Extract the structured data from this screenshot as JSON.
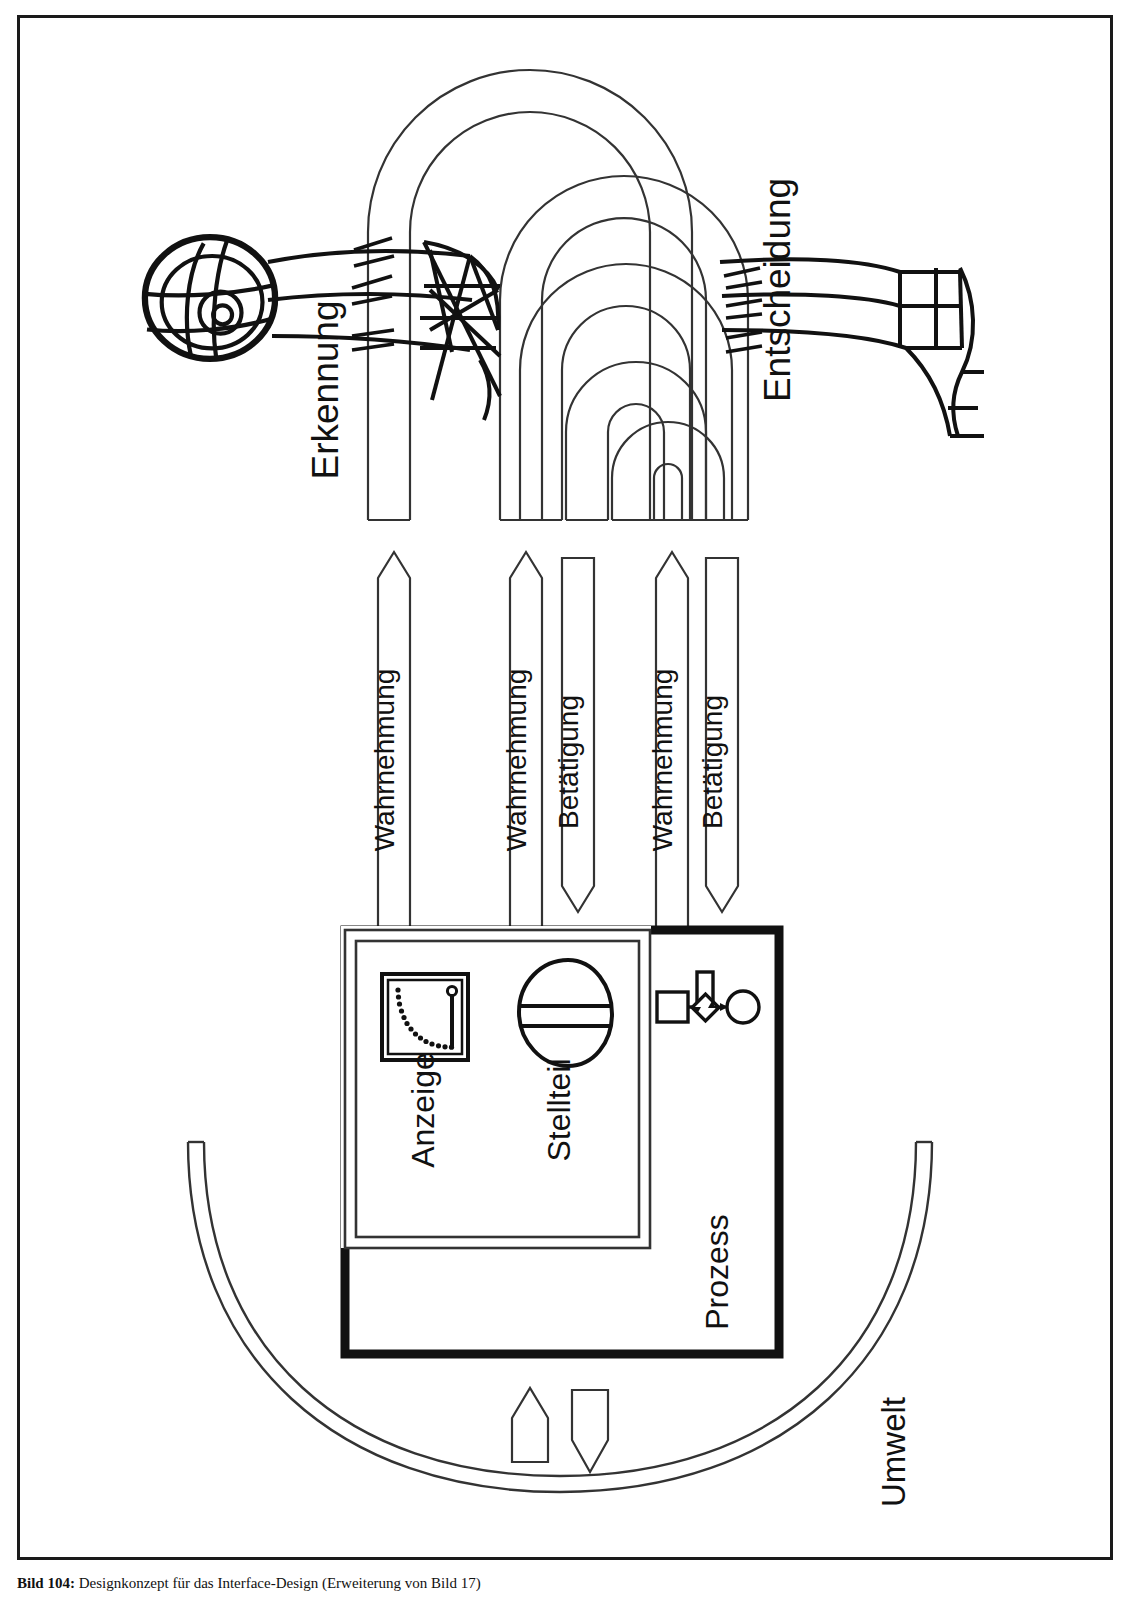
{
  "figure": {
    "caption_label": "Bild 104:",
    "caption_text": " Designkonzept für das Interface-Design (Erweiterung von Bild 17)"
  },
  "labels": {
    "erkennung": "Erkennung",
    "entscheidung": "Entscheidung",
    "umwelt": "Umwelt",
    "anzeige": "Anzeige",
    "stellteil": "Stellteil",
    "prozess": "Prozess"
  },
  "flows": [
    {
      "id": "wahrnehmung-1",
      "label": "Wahrnehmung",
      "direction": "up"
    },
    {
      "id": "wahrnehmung-2",
      "label": "Wahrnehmung",
      "direction": "up"
    },
    {
      "id": "betaetigung-1",
      "label": "Betätigung",
      "direction": "down"
    },
    {
      "id": "wahrnehmung-3",
      "label": "Wahrnehmung",
      "direction": "up"
    },
    {
      "id": "betaetigung-2",
      "label": "Betätigung",
      "direction": "down"
    }
  ],
  "icons": {
    "human_head": "human-head-wireframe-icon",
    "human_hand": "human-hand-wireframe-icon",
    "gauge": "gauge-display-icon",
    "knob": "control-knob-icon",
    "process_chain": "process-flow-icon"
  },
  "colors": {
    "stroke": "#1a1a1a",
    "thin_stroke": "#333333",
    "background": "#ffffff"
  }
}
